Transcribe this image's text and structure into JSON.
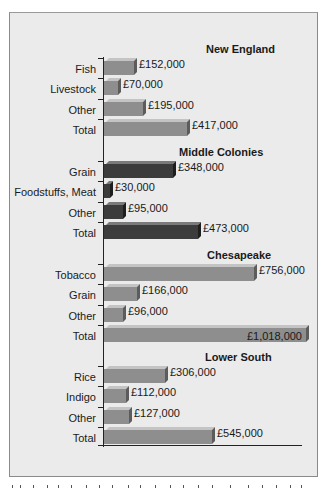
{
  "chart_data": {
    "type": "bar",
    "orientation": "horizontal",
    "title": "",
    "xlabel": "",
    "ylabel": "",
    "currency": "£",
    "grid": false,
    "legend": null,
    "groups": [
      {
        "name": "New England",
        "style": "light",
        "categories": [
          "Fish",
          "Livestock",
          "Other",
          "Total"
        ],
        "values": [
          152000,
          70000,
          195000,
          417000
        ],
        "labels": [
          "£152,000",
          "£70,000",
          "£195,000",
          "£417,000"
        ]
      },
      {
        "name": "Middle Colonies",
        "style": "dark",
        "categories": [
          "Grain",
          "Foodstuffs, Meat",
          "Other",
          "Total"
        ],
        "values": [
          348000,
          30000,
          95000,
          473000
        ],
        "labels": [
          "£348,000",
          "£30,000",
          "£95,000",
          "£473,000"
        ]
      },
      {
        "name": "Chesapeake",
        "style": "light",
        "categories": [
          "Tobacco",
          "Grain",
          "Other",
          "Total"
        ],
        "values": [
          756000,
          166000,
          96000,
          1018000
        ],
        "labels": [
          "£756,000",
          "£166,000",
          "£96,000",
          "£1,018,000"
        ]
      },
      {
        "name": "Lower South",
        "style": "light",
        "categories": [
          "Rice",
          "Indigo",
          "Other",
          "Total"
        ],
        "values": [
          306000,
          112000,
          127000,
          545000
        ],
        "labels": [
          "£306,000",
          "£112,000",
          "£127,000",
          "£545,000"
        ]
      }
    ],
    "colors": {
      "light_bar": "#8e8e8e",
      "dark_bar": "#3c3c3c",
      "background": "#ebebeb"
    }
  }
}
